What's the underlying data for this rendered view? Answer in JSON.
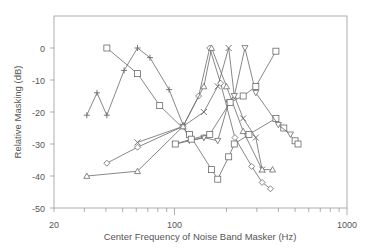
{
  "chart_data": {
    "type": "line",
    "title": "",
    "xlabel": "Center Frequency of Noise Band Masker (Hz)",
    "ylabel": "Relative Masking (dB)",
    "xscale": "log",
    "xlim": [
      20,
      1000
    ],
    "ylim": [
      -50,
      10
    ],
    "xticks": [
      {
        "value": 20,
        "label": "20"
      },
      {
        "value": 100,
        "label": "100"
      },
      {
        "value": 1000,
        "label": "1000"
      }
    ],
    "yticks": [
      {
        "value": 0,
        "label": "0"
      },
      {
        "value": -10,
        "label": "-10"
      },
      {
        "value": -20,
        "label": "-20"
      },
      {
        "value": -30,
        "label": "-30"
      },
      {
        "value": -40,
        "label": "-40"
      },
      {
        "value": -50,
        "label": "-50"
      }
    ],
    "grid": false,
    "legend": "none",
    "series": [
      {
        "name": "plus",
        "marker": "plus",
        "x": [
          31,
          35.5,
          40.5,
          51,
          61,
          72,
          93,
          112,
          122,
          148
        ],
        "y": [
          -21,
          -14,
          -21,
          -7,
          0,
          -3,
          -13,
          -24,
          -29,
          -28
        ]
      },
      {
        "name": "square-low",
        "marker": "square",
        "x": [
          40.5,
          61,
          82,
          122,
          164,
          178,
          206,
          222,
          270,
          387,
          430,
          500,
          520
        ],
        "y": [
          0,
          -8,
          -18,
          -27,
          -38,
          -41,
          -34,
          -30,
          -27,
          -22,
          -25,
          -29,
          -30
        ]
      },
      {
        "name": "x-series",
        "marker": "x",
        "x": [
          61,
          112,
          148,
          178,
          206,
          222,
          250,
          296,
          322
        ],
        "y": [
          -29.5,
          -24.5,
          -20,
          -12,
          0,
          -15,
          -22,
          -28,
          -38
        ]
      },
      {
        "name": "diamond",
        "marker": "diamond",
        "x": [
          40.5,
          61,
          112,
          138,
          160,
          185,
          224,
          280,
          322,
          360
        ],
        "y": [
          -36,
          -31,
          -24.5,
          -15,
          0,
          -11,
          -28,
          -37,
          -42,
          -44
        ]
      },
      {
        "name": "triangle",
        "marker": "triangle",
        "x": [
          31,
          61,
          112,
          148,
          164,
          200,
          250,
          322,
          370
        ],
        "y": [
          -40,
          -38.5,
          -24.5,
          -12,
          0,
          -12,
          -26,
          -38,
          -38
        ]
      },
      {
        "name": "down-triangle",
        "marker": "down-triangle",
        "x": [
          101,
          148,
          178,
          206,
          222,
          256,
          296,
          400,
          470
        ],
        "y": [
          -30,
          -28,
          -29,
          -17,
          -15,
          0,
          -14,
          -24,
          -27
        ]
      },
      {
        "name": "square-high",
        "marker": "square",
        "x": [
          101,
          125,
          160,
          210,
          250,
          296,
          387
        ],
        "y": [
          -30,
          -28.5,
          -27,
          -17,
          -15,
          -12,
          -1
        ]
      }
    ]
  }
}
